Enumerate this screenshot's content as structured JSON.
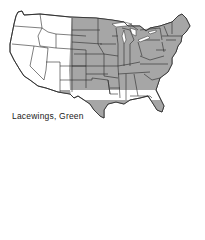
{
  "map": {
    "title": "Lacewings, Green",
    "subject": "Green Lacewings range map",
    "region": "Contiguous United States",
    "legend": {
      "shaded": "Range of species",
      "unshaded": "Not present"
    },
    "colors": {
      "shaded_fill": "#a6a6a6",
      "unshaded_fill": "#ffffff",
      "border": "#2a2a2a",
      "background": "#ffffff"
    },
    "range_west_boundary_note": "Range boundary runs through eastern Montana, Wyoming, Colorado and New Mexico",
    "shaded_states": [
      "ND",
      "SD",
      "NE",
      "KS",
      "OK",
      "TX",
      "MN",
      "IA",
      "MO",
      "AR",
      "LA",
      "WI",
      "IL",
      "MS",
      "MI",
      "IN",
      "KY",
      "TN",
      "AL",
      "OH",
      "GA",
      "FL",
      "SC",
      "NC",
      "VA",
      "WV",
      "PA",
      "NY",
      "VT",
      "NH",
      "ME",
      "MA",
      "RI",
      "CT",
      "NJ",
      "DE",
      "MD"
    ],
    "partially_shaded_states": [
      "MT",
      "WY",
      "CO",
      "NM"
    ],
    "unshaded_states": [
      "WA",
      "OR",
      "CA",
      "NV",
      "ID",
      "UT",
      "AZ"
    ]
  }
}
